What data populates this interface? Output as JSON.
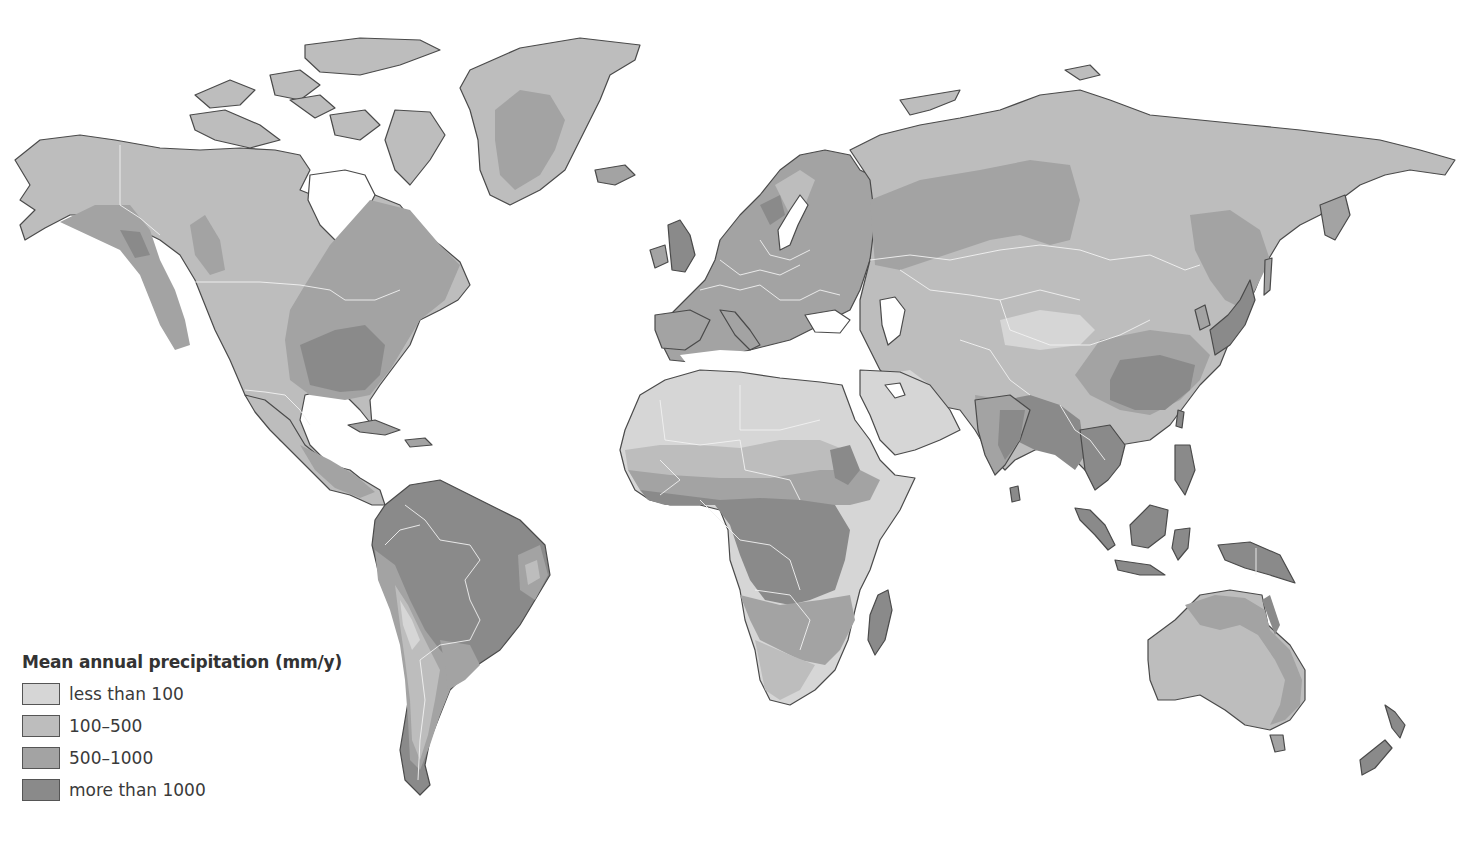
{
  "map": {
    "title": "Mean annual precipitation (mm/y)",
    "projection": "world map",
    "background_color": "#ffffff",
    "coastline_color": "#4a4a4a",
    "border_color": "#f2f2f2"
  },
  "legend": {
    "title": "Mean annual precipitation (mm/y)",
    "position": "bottom-left",
    "items": [
      {
        "label": "less than 100",
        "color": "#d6d6d6"
      },
      {
        "label": "100–500",
        "color": "#bdbdbd"
      },
      {
        "label": "500–1000",
        "color": "#a3a3a3"
      },
      {
        "label": "more than 1000",
        "color": "#8a8a8a"
      }
    ]
  },
  "regions": [
    {
      "name": "North America",
      "dominant_classes": [
        "100–500",
        "500–1000",
        "more than 1000"
      ]
    },
    {
      "name": "Greenland",
      "dominant_classes": [
        "100–500",
        "500–1000"
      ]
    },
    {
      "name": "South America",
      "dominant_classes": [
        "more than 1000",
        "500–1000",
        "100–500"
      ]
    },
    {
      "name": "Europe",
      "dominant_classes": [
        "500–1000",
        "more than 1000"
      ]
    },
    {
      "name": "Africa",
      "dominant_classes": [
        "less than 100",
        "100–500",
        "500–1000",
        "more than 1000"
      ]
    },
    {
      "name": "Asia",
      "dominant_classes": [
        "100–500",
        "500–1000",
        "more than 1000",
        "less than 100"
      ]
    },
    {
      "name": "Australia",
      "dominant_classes": [
        "100–500",
        "500–1000"
      ]
    },
    {
      "name": "New Zealand",
      "dominant_classes": [
        "more than 1000"
      ]
    }
  ]
}
